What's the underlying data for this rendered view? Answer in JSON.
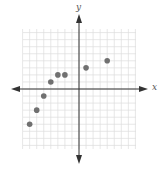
{
  "chart_data": {
    "type": "scatter",
    "title": "",
    "xlabel": "x",
    "ylabel": "y",
    "xlim": [
      -8,
      8
    ],
    "ylim": [
      -8,
      8
    ],
    "grid": true,
    "legend": null,
    "tick_labels": false,
    "points": [
      {
        "x": -7,
        "y": -5
      },
      {
        "x": -6,
        "y": -3
      },
      {
        "x": -5,
        "y": -1
      },
      {
        "x": -4,
        "y": 1
      },
      {
        "x": -3,
        "y": 2
      },
      {
        "x": -2,
        "y": 2
      },
      {
        "x": 1,
        "y": 3
      },
      {
        "x": 4,
        "y": 4
      }
    ]
  },
  "colors": {
    "grid": "#dcdcdc",
    "axis": "#333333",
    "point": "#707070"
  },
  "layout": {
    "origin_px": [
      79,
      89
    ],
    "cell_px": 7.05,
    "grid_left": 23,
    "grid_right": 136,
    "grid_top": 29,
    "grid_bottom": 149
  }
}
